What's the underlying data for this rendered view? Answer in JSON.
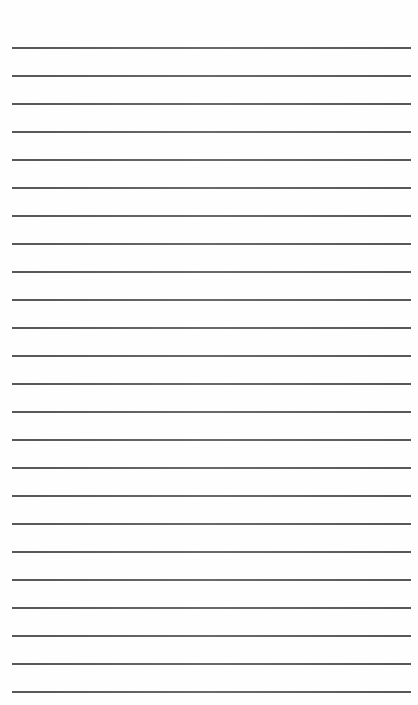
{
  "page": {
    "type": "lined-paper",
    "background_color": "#fefefe",
    "line_color": "#444444",
    "line_count": 24,
    "first_line_y": 47,
    "line_spacing": 28,
    "line_left": 12,
    "line_right": 411,
    "text_lines": []
  }
}
